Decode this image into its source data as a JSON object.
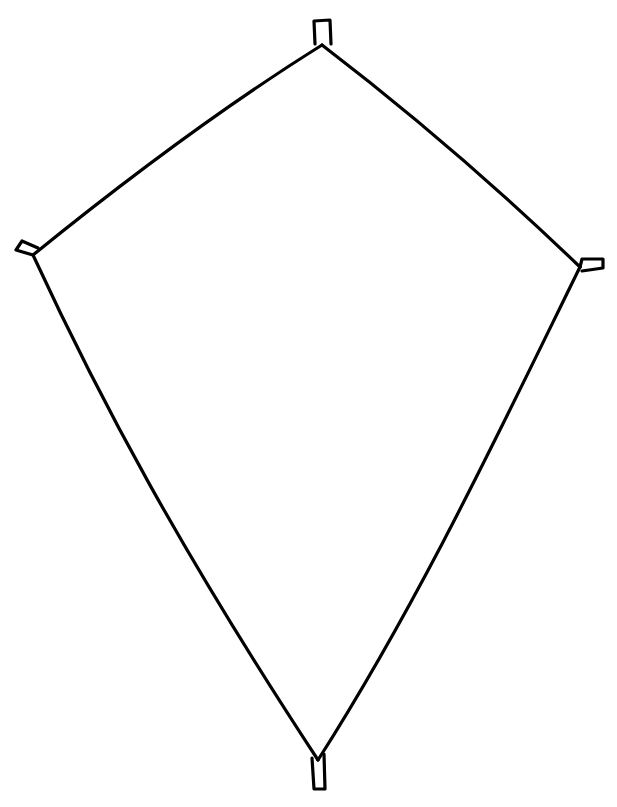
{
  "figure": {
    "stroke_color": "#000000",
    "background_color": "#ffffff",
    "vertices": {
      "top": [
        322,
        45
      ],
      "left": [
        33,
        255
      ],
      "right": [
        580,
        267
      ],
      "bottom": [
        318,
        760
      ]
    },
    "tabs": [
      "top",
      "left",
      "right",
      "bottom"
    ]
  }
}
